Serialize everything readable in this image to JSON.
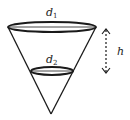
{
  "diagram": {
    "labels": {
      "d1_main": "d",
      "d1_sub": "1",
      "d2_main": "d",
      "d2_sub": "2",
      "h": "h"
    },
    "colors": {
      "stroke": "#1a1a1a",
      "text": "#222222",
      "background": "#ffffff"
    },
    "shapes": {
      "cone": {
        "apex": [
          51,
          114
        ],
        "left_rim": [
          8,
          27
        ],
        "right_rim": [
          96,
          27
        ]
      },
      "top_ellipse": {
        "cx": 52,
        "cy": 27,
        "rx": 44,
        "ry": 5,
        "label": "d1"
      },
      "lower_ellipse": {
        "cx": 52,
        "cy": 71,
        "rx": 21,
        "ry": 4,
        "label": "d2"
      },
      "height_arrow": {
        "x": 106,
        "y_top": 28,
        "y_bottom": 74,
        "style": "dashed",
        "double_headed": true,
        "label": "h"
      }
    }
  }
}
